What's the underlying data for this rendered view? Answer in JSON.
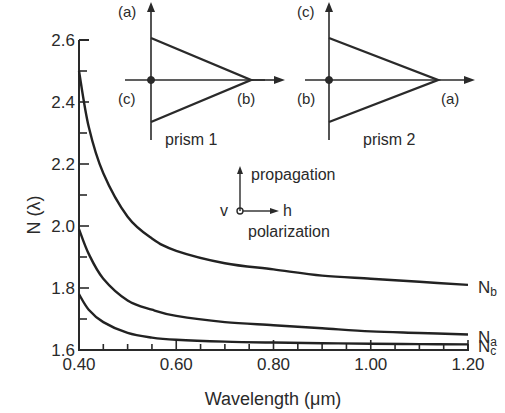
{
  "chart_data": {
    "type": "line",
    "title": "",
    "xlabel": "Wavelength (μm)",
    "ylabel": "N (λ)",
    "xlim": [
      0.4,
      1.2
    ],
    "ylim": [
      1.6,
      2.6
    ],
    "x_ticks": [
      "0.40",
      "0.60",
      "0.80",
      "1.00",
      "1.20"
    ],
    "y_ticks": [
      "1.6",
      "1.8",
      "2.0",
      "2.2",
      "2.4",
      "2.6"
    ],
    "grid": false,
    "series": [
      {
        "name": "Nb",
        "label_main": "N",
        "label_sub": "b",
        "x": [
          0.4,
          0.42,
          0.45,
          0.5,
          0.55,
          0.6,
          0.7,
          0.8,
          0.9,
          1.0,
          1.1,
          1.2
        ],
        "y": [
          2.5,
          2.32,
          2.17,
          2.03,
          1.96,
          1.92,
          1.88,
          1.86,
          1.84,
          1.83,
          1.82,
          1.81
        ]
      },
      {
        "name": "Na",
        "label_main": "N",
        "label_sub": "a",
        "x": [
          0.4,
          0.42,
          0.45,
          0.5,
          0.55,
          0.6,
          0.7,
          0.8,
          0.9,
          1.0,
          1.1,
          1.2
        ],
        "y": [
          1.99,
          1.91,
          1.83,
          1.76,
          1.73,
          1.71,
          1.69,
          1.68,
          1.67,
          1.66,
          1.655,
          1.65
        ]
      },
      {
        "name": "Nc",
        "label_main": "N",
        "label_sub": "c",
        "x": [
          0.4,
          0.42,
          0.45,
          0.5,
          0.55,
          0.6,
          0.7,
          0.8,
          0.9,
          1.0,
          1.1,
          1.2
        ],
        "y": [
          1.78,
          1.73,
          1.69,
          1.655,
          1.64,
          1.633,
          1.627,
          1.624,
          1.622,
          1.62,
          1.619,
          1.618
        ]
      }
    ],
    "annotations": {
      "prism1": {
        "label": "prism 1",
        "top": "(a)",
        "left": "(c)",
        "right": "(b)"
      },
      "prism2": {
        "label": "prism 2",
        "top": "(c)",
        "left": "(b)",
        "right": "(a)"
      },
      "axes_legend": {
        "up": "propagation",
        "dot": "v",
        "right": "h",
        "below": "polarization"
      }
    }
  }
}
